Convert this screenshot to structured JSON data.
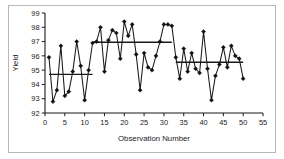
{
  "chart_data": {
    "type": "line",
    "title": "",
    "xlabel": "Observation Number",
    "ylabel": "Yield",
    "xlim": [
      0,
      55
    ],
    "ylim": [
      92,
      99
    ],
    "xticks": [
      0,
      5,
      10,
      15,
      20,
      25,
      30,
      35,
      40,
      45,
      50,
      55
    ],
    "yticks": [
      92,
      93,
      94,
      95,
      96,
      97,
      98,
      99
    ],
    "grid": false,
    "legend": null,
    "marker": "diamond",
    "line_color": "#1a1a1a",
    "marker_color": "#111111",
    "x": [
      1,
      2,
      3,
      4,
      5,
      6,
      7,
      8,
      9,
      10,
      11,
      12,
      13,
      14,
      15,
      16,
      17,
      18,
      19,
      20,
      21,
      22,
      23,
      24,
      25,
      26,
      27,
      28,
      29,
      30,
      31,
      32,
      33,
      34,
      35,
      36,
      37,
      38,
      39,
      40,
      41,
      42,
      43,
      44,
      45,
      46,
      47,
      48,
      49,
      50
    ],
    "values": [
      95.9,
      92.8,
      93.6,
      96.7,
      93.2,
      93.5,
      94.9,
      97.0,
      95.3,
      92.9,
      95.0,
      96.9,
      97.0,
      98.0,
      94.9,
      97.1,
      97.8,
      97.6,
      95.8,
      98.4,
      97.4,
      98.2,
      96.1,
      93.6,
      96.2,
      95.2,
      95.0,
      96.0,
      97.0,
      98.2,
      98.2,
      98.1,
      95.9,
      94.4,
      96.5,
      94.9,
      96.2,
      95.1,
      94.8,
      97.7,
      95.1,
      92.9,
      94.6,
      95.4,
      96.6,
      95.2,
      96.7,
      96.0,
      95.8,
      94.4
    ],
    "series": [
      {
        "name": "Yield",
        "values": [
          95.9,
          92.8,
          93.6,
          96.7,
          93.2,
          93.5,
          94.9,
          97.0,
          95.3,
          92.9,
          95.0,
          96.9,
          97.0,
          98.0,
          94.9,
          97.1,
          97.8,
          97.6,
          95.8,
          98.4,
          97.4,
          98.2,
          96.1,
          93.6,
          96.2,
          95.2,
          95.0,
          96.0,
          97.0,
          98.2,
          98.2,
          98.1,
          95.9,
          94.4,
          96.5,
          94.9,
          96.2,
          95.1,
          94.8,
          97.7,
          95.1,
          92.9,
          94.6,
          95.4,
          96.6,
          95.2,
          96.7,
          96.0,
          95.8,
          94.4
        ]
      }
    ],
    "reference_segments": [
      {
        "label": "mean-segment-1",
        "x_start": 1,
        "x_end": 12,
        "y": 94.7
      },
      {
        "label": "mean-segment-2",
        "x_start": 12,
        "x_end": 32,
        "y": 96.95
      },
      {
        "label": "mean-segment-3",
        "x_start": 33,
        "x_end": 50,
        "y": 95.55
      }
    ]
  }
}
